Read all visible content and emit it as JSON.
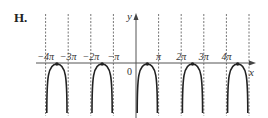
{
  "option": {
    "label": "H."
  },
  "chart_data": {
    "type": "line",
    "title": "",
    "xlabel": "x",
    "ylabel": "y",
    "origin_label": "0",
    "x_ticks": [
      {
        "value": -4,
        "label": "−4π"
      },
      {
        "value": -3,
        "label": "−3π"
      },
      {
        "value": -2,
        "label": "−2π"
      },
      {
        "value": -1,
        "label": "−π"
      },
      {
        "value": 1,
        "label": "π"
      },
      {
        "value": 2,
        "label": "2π"
      },
      {
        "value": 3,
        "label": "3π"
      },
      {
        "value": 4,
        "label": "4π"
      }
    ],
    "asymptotes_pi": [
      -4,
      -3,
      -2,
      -1,
      0,
      1,
      2,
      3,
      4,
      5
    ],
    "branches": [
      {
        "from_pi": -4,
        "to_pi": -3,
        "peak_pi": -3.5,
        "peak_y": 0
      },
      {
        "from_pi": -2,
        "to_pi": -1,
        "peak_pi": -1.5,
        "peak_y": 0
      },
      {
        "from_pi": 0,
        "to_pi": 1,
        "peak_pi": 0.5,
        "peak_y": 0
      },
      {
        "from_pi": 2,
        "to_pi": 3,
        "peak_pi": 2.5,
        "peak_y": 0
      },
      {
        "from_pi": 4,
        "to_pi": 5,
        "peak_pi": 4.5,
        "peak_y": 0
      }
    ],
    "grid": false,
    "legend": null
  },
  "colors": {
    "curve": "#222222",
    "axis": "#555555",
    "asymptote": "#777777"
  }
}
